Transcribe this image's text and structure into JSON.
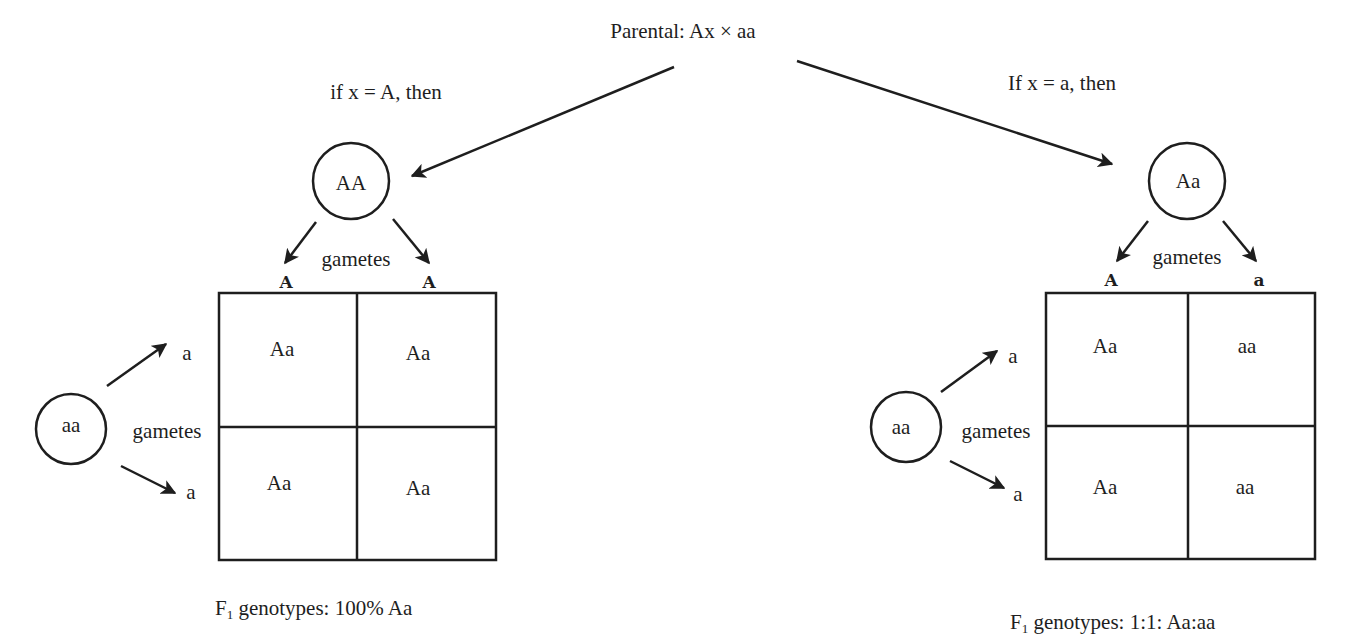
{
  "title": "Parental: Ax × aa",
  "left_case": {
    "condition": "if x = A, then",
    "parent_genotype": "AA",
    "parent_gametes_label": "gametes",
    "column_gametes": [
      "A",
      "A"
    ],
    "other_parent_genotype": "aa",
    "other_gametes_label": "gametes",
    "row_gametes": [
      "a",
      "a"
    ],
    "punnett": [
      [
        "Aa",
        "Aa"
      ],
      [
        "Aa",
        "Aa"
      ]
    ],
    "result_prefix": "F",
    "result_sub": "1",
    "result_text": " genotypes: 100% Aa"
  },
  "right_case": {
    "condition": "If x = a, then",
    "parent_genotype": "Aa",
    "parent_gametes_label": "gametes",
    "column_gametes": [
      "A",
      "a"
    ],
    "other_parent_genotype": "aa",
    "other_gametes_label": "gametes",
    "row_gametes": [
      "a",
      "a"
    ],
    "punnett": [
      [
        "Aa",
        "aa"
      ],
      [
        "Aa",
        "aa"
      ]
    ],
    "result_prefix": "F",
    "result_sub": "1",
    "result_text": " genotypes: 1:1: Aa:aa"
  },
  "colors": {
    "ink": "#1e1e1e",
    "background": "#ffffff"
  }
}
